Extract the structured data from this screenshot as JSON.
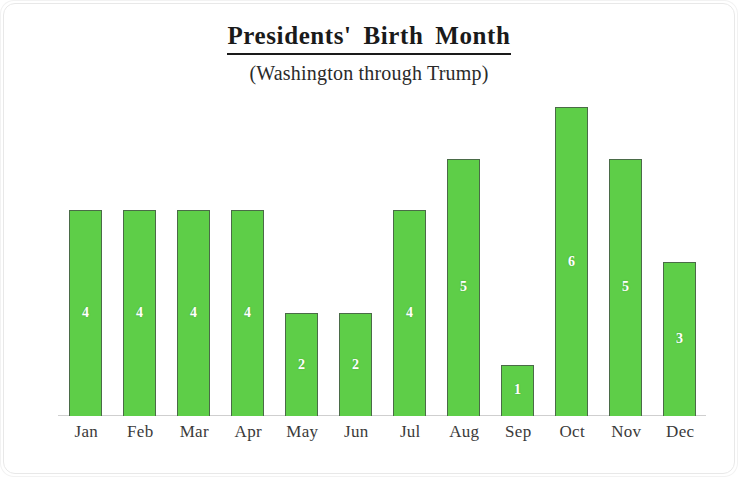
{
  "chart_data": {
    "type": "bar",
    "title": "Presidents'  Birth  Month",
    "subtitle": "(Washington through Trump)",
    "xlabel": "",
    "ylabel": "number of Presidents born each month",
    "categories": [
      "Jan",
      "Feb",
      "Mar",
      "Apr",
      "May",
      "Jun",
      "Jul",
      "Aug",
      "Sep",
      "Oct",
      "Nov",
      "Dec"
    ],
    "values": [
      4,
      4,
      4,
      4,
      2,
      2,
      4,
      5,
      1,
      6,
      5,
      3
    ],
    "data_labels": [
      "4",
      "4",
      "4",
      "4",
      "2",
      "2",
      "4",
      "5",
      "1",
      "6",
      "5",
      "3"
    ],
    "ylim": [
      0,
      6.3
    ],
    "grid": false,
    "legend": null,
    "bar_color": "#5ECE48",
    "bar_border_color": "#4a6b47",
    "data_label_color": "#ffffff",
    "axis_color": "#cfcfcf",
    "background": "#ffffff"
  }
}
